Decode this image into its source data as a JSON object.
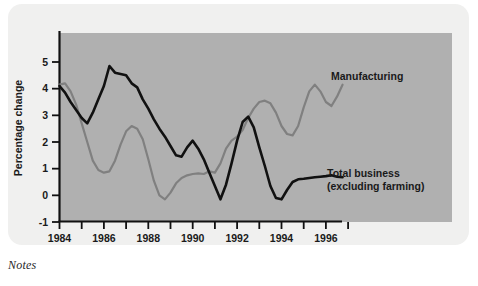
{
  "figure": {
    "notes_label": "Notes",
    "panel_color": "#b0b0b0",
    "card_color": "#f0f0ef"
  },
  "chart_data": {
    "type": "line",
    "title": "",
    "xlabel": "",
    "ylabel": "Percentage change",
    "xlim": [
      1984,
      1997.5
    ],
    "ylim": [
      -1,
      5.4
    ],
    "yticks": [
      -1,
      0,
      1,
      2,
      3,
      4,
      5
    ],
    "ytick_labels": [
      "-1",
      "0",
      "1",
      "2",
      "3",
      "4",
      "5"
    ],
    "xticks": [
      1984,
      1985,
      1986,
      1987,
      1988,
      1989,
      1990,
      1991,
      1992,
      1993,
      1994,
      1995,
      1996,
      1997
    ],
    "xtick_labels": [
      "1984",
      "",
      "1986",
      "",
      "1988",
      "",
      "1990",
      "",
      "1992",
      "",
      "1994",
      "",
      "1996",
      ""
    ],
    "grid": false,
    "legend_position": "inline-annotations",
    "series": [
      {
        "name": "Manufacturing",
        "color": "#808080",
        "label_text": "Manufacturing",
        "x": [
          1984.0,
          1984.25,
          1984.5,
          1984.75,
          1985.0,
          1985.25,
          1985.5,
          1985.75,
          1986.0,
          1986.25,
          1986.5,
          1986.75,
          1987.0,
          1987.25,
          1987.5,
          1987.75,
          1988.0,
          1988.25,
          1988.5,
          1988.75,
          1989.0,
          1989.25,
          1989.5,
          1989.75,
          1990.0,
          1990.25,
          1990.5,
          1990.75,
          1991.0,
          1991.25,
          1991.5,
          1991.75,
          1992.0,
          1992.25,
          1992.5,
          1992.75,
          1993.0,
          1993.25,
          1993.5,
          1993.75,
          1994.0,
          1994.25,
          1994.5,
          1994.75,
          1995.0,
          1995.25,
          1995.5,
          1995.75,
          1996.0,
          1996.25,
          1996.5,
          1996.75
        ],
        "y": [
          4.15,
          4.2,
          3.9,
          3.4,
          2.7,
          2.0,
          1.3,
          0.95,
          0.85,
          0.9,
          1.3,
          1.9,
          2.4,
          2.6,
          2.5,
          2.1,
          1.35,
          0.55,
          0.0,
          -0.15,
          0.1,
          0.45,
          0.65,
          0.75,
          0.8,
          0.82,
          0.8,
          0.9,
          0.85,
          1.2,
          1.75,
          2.05,
          2.2,
          2.45,
          2.9,
          3.25,
          3.5,
          3.55,
          3.45,
          3.1,
          2.6,
          2.3,
          2.25,
          2.6,
          3.3,
          3.9,
          4.15,
          3.9,
          3.5,
          3.35,
          3.7,
          4.15
        ]
      },
      {
        "name": "Total business (excluding farming)",
        "color": "#111111",
        "label_text": "Total business\n(excluding farming)",
        "x": [
          1984.0,
          1984.25,
          1984.5,
          1984.75,
          1985.0,
          1985.25,
          1985.5,
          1985.75,
          1986.0,
          1986.25,
          1986.5,
          1986.75,
          1987.0,
          1987.25,
          1987.5,
          1987.75,
          1988.0,
          1988.25,
          1988.5,
          1988.75,
          1989.0,
          1989.25,
          1989.5,
          1989.75,
          1990.0,
          1990.25,
          1990.5,
          1990.75,
          1991.0,
          1991.25,
          1991.5,
          1991.75,
          1992.0,
          1992.25,
          1992.5,
          1992.75,
          1993.0,
          1993.25,
          1993.5,
          1993.75,
          1994.0,
          1994.25,
          1994.5,
          1994.75,
          1995.0,
          1995.25,
          1995.5,
          1995.75,
          1996.0,
          1996.25,
          1996.5,
          1996.75
        ],
        "y": [
          4.1,
          3.85,
          3.5,
          3.2,
          2.9,
          2.7,
          3.1,
          3.6,
          4.1,
          4.85,
          4.6,
          4.55,
          4.5,
          4.2,
          4.05,
          3.6,
          3.25,
          2.85,
          2.5,
          2.2,
          1.85,
          1.5,
          1.45,
          1.8,
          2.05,
          1.75,
          1.35,
          0.85,
          0.35,
          -0.15,
          0.4,
          1.2,
          2.05,
          2.75,
          2.95,
          2.55,
          1.8,
          1.1,
          0.35,
          -0.1,
          -0.15,
          0.2,
          0.5,
          0.6,
          0.62,
          0.65,
          0.68,
          0.7,
          0.72,
          0.75,
          0.7,
          0.68
        ]
      }
    ],
    "annotations": [
      {
        "text": "Manufacturing",
        "series": "Manufacturing"
      },
      {
        "text": "Total business",
        "series": "Total business (excluding farming)"
      },
      {
        "text": "(excluding farming)",
        "series": "Total business (excluding farming)"
      }
    ]
  }
}
